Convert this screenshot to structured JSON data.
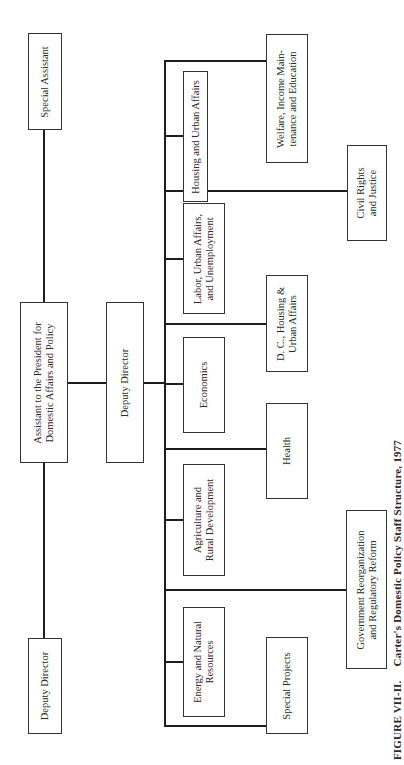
{
  "figure": {
    "label": "FIGURE VII-II.",
    "title": "Carter's Domestic Policy Staff Structure, 1977",
    "orientation": "rotated 90° counter-clockwise"
  },
  "nodes": {
    "special_assistant": {
      "lines": [
        "Special Assistant"
      ]
    },
    "assistant_to_president": {
      "lines": [
        "Assistant to the President for",
        "Domestic Affairs and Policy"
      ]
    },
    "deputy_director_left": {
      "lines": [
        "Deputy Director"
      ]
    },
    "deputy_director_center": {
      "lines": [
        "Deputy Director"
      ]
    },
    "housing_urban": {
      "lines": [
        "Housing and Urban Affairs"
      ]
    },
    "labor": {
      "lines": [
        "Labor, Urban Affairs,",
        "and Unemployment"
      ]
    },
    "economics": {
      "lines": [
        "Economics"
      ]
    },
    "agriculture": {
      "lines": [
        "Agriculture and",
        "Rural Development"
      ]
    },
    "energy": {
      "lines": [
        "Energy and Natural",
        "Resources"
      ]
    },
    "welfare": {
      "lines": [
        "Welfare, Income Main-",
        "tenance and Education"
      ]
    },
    "dc_housing": {
      "lines": [
        "D. C., Housing &",
        "Urban Affairs"
      ]
    },
    "health": {
      "lines": [
        "Health"
      ]
    },
    "special_projects": {
      "lines": [
        "Special Projects"
      ]
    },
    "civil_rights": {
      "lines": [
        "Civil Rights",
        "and Justice"
      ]
    },
    "gov_reorg": {
      "lines": [
        "Government Reorganization",
        "and Regulatory Reform"
      ]
    }
  },
  "hierarchy": {
    "root": "Assistant to the President for Domestic Affairs and Policy",
    "peers_of_root": [
      "Special Assistant",
      "Deputy Director"
    ],
    "reports_to_root": "Deputy Director",
    "units_under_deputy_director": [
      "Housing and Urban Affairs",
      "Labor, Urban Affairs, and Unemployment",
      "Economics",
      "Agriculture and Rural Development",
      "Energy and Natural Resources",
      "Welfare, Income Maintenance and Education",
      "D. C., Housing & Urban Affairs",
      "Health",
      "Special Projects",
      "Civil Rights and Justice",
      "Government Reorganization and Regulatory Reform"
    ]
  }
}
